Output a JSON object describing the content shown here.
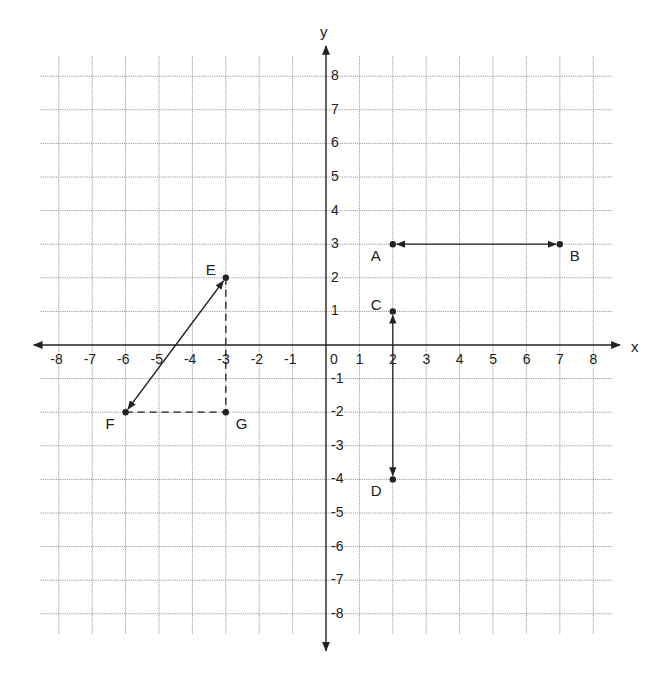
{
  "axes": {
    "x_label": "x",
    "y_label": "y",
    "x_ticks": [
      "-8",
      "-7",
      "-6",
      "-5",
      "-4",
      "-3",
      "-2",
      "-1",
      "0",
      "1",
      "2",
      "3",
      "4",
      "5",
      "6",
      "7",
      "8"
    ],
    "y_ticks": [
      "8",
      "7",
      "6",
      "5",
      "4",
      "3",
      "2",
      "1",
      "-1",
      "-2",
      "-3",
      "-4",
      "-5",
      "-6",
      "-7",
      "-8"
    ],
    "range": {
      "xmin": -8,
      "xmax": 8,
      "ymin": -8,
      "ymax": 8
    }
  },
  "points": [
    {
      "name": "A",
      "x": 2,
      "y": 3
    },
    {
      "name": "B",
      "x": 7,
      "y": 3
    },
    {
      "name": "C",
      "x": 2,
      "y": 1
    },
    {
      "name": "D",
      "x": 2,
      "y": -4
    },
    {
      "name": "E",
      "x": -3,
      "y": 2
    },
    {
      "name": "F",
      "x": -6,
      "y": -2
    },
    {
      "name": "G",
      "x": -3,
      "y": -2
    }
  ],
  "segments": [
    {
      "from": "A",
      "to": "B",
      "style": "solid",
      "arrows": "both"
    },
    {
      "from": "C",
      "to": "D",
      "style": "solid",
      "arrows": "both"
    },
    {
      "from": "E",
      "to": "F",
      "style": "solid",
      "arrows": "both"
    },
    {
      "from": "E",
      "to": "G",
      "style": "dashed",
      "arrows": "none"
    },
    {
      "from": "F",
      "to": "G",
      "style": "dashed",
      "arrows": "none"
    }
  ],
  "colors": {
    "ink": "#222222",
    "grid": "#9a9a9a",
    "background": "#ffffff"
  }
}
